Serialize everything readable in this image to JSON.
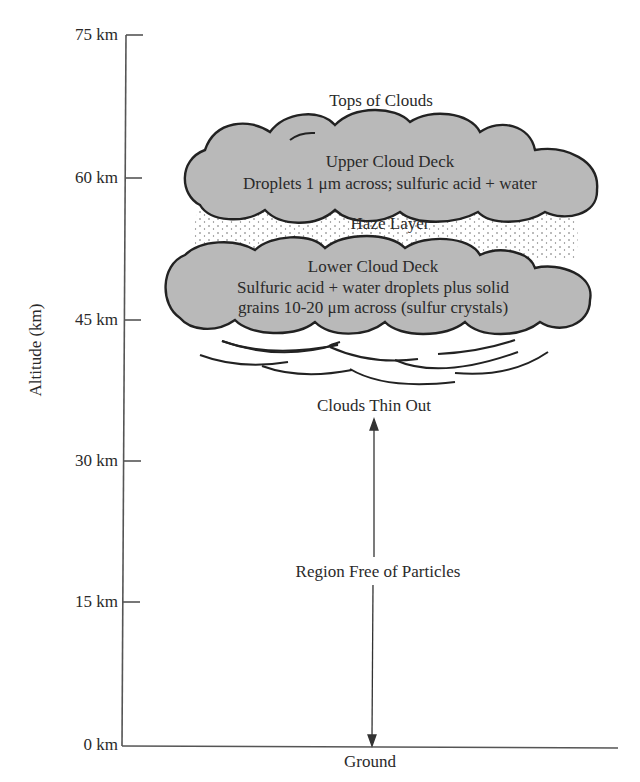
{
  "diagram": {
    "type": "atmospheric-profile",
    "y_axis": {
      "label": "Altitude (km)",
      "ticks": [
        "75 km",
        "60 km",
        "45 km",
        "30 km",
        "15 km",
        "0 km"
      ],
      "values": [
        75,
        60,
        45,
        30,
        15,
        0
      ]
    },
    "x_axis": {
      "label": "Ground"
    },
    "layers": {
      "tops_label": "Tops of Clouds",
      "upper_cloud": {
        "title": "Upper Cloud Deck",
        "desc": "Droplets 1 μm across; sulfuric acid  +  water"
      },
      "haze": {
        "title": "Haze Layer"
      },
      "lower_cloud": {
        "title": "Lower Cloud Deck",
        "desc_line1": "Sulfuric acid  +  water droplets plus solid",
        "desc_line2": "grains 10-20 μm across (sulfur crystals)"
      },
      "thin_label": "Clouds Thin Out",
      "free_region": "Region Free of Particles"
    },
    "colors": {
      "cloud_fill": "#b9b9b9",
      "outline": "#222222",
      "axis": "#555555"
    }
  }
}
